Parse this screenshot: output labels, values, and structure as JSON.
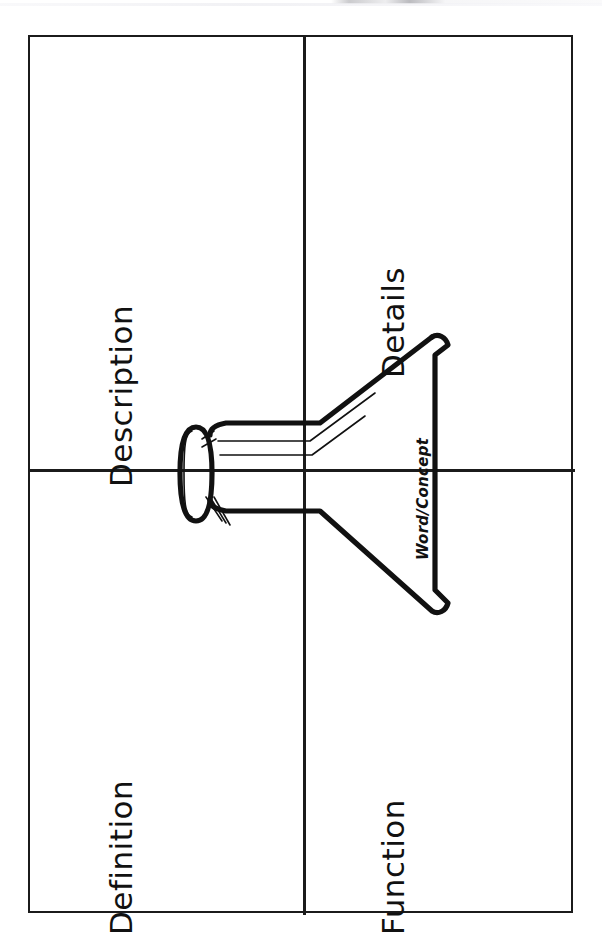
{
  "page": {
    "orientation": "rotated-90",
    "background_color": "#ffffff",
    "ink_color": "#1b1b1b"
  },
  "worksheet": {
    "frame": {
      "border_color": "#1b1b1b",
      "border_width_px": 2.5
    },
    "dividers": {
      "vertical_label": "vertical-divider",
      "horizontal_label": "horizontal-divider"
    },
    "quadrants": [
      {
        "id": "description",
        "label": "Description",
        "position": "upper-left"
      },
      {
        "id": "details",
        "label": "Details",
        "position": "upper-right"
      },
      {
        "id": "definition",
        "label": "Definition",
        "position": "lower-left"
      },
      {
        "id": "function",
        "label": "Function",
        "position": "lower-right"
      }
    ]
  },
  "center_banner": {
    "name": "ribbon-banner",
    "label": "Word/Concept",
    "style": "italic",
    "stroke_color": "#111111"
  }
}
